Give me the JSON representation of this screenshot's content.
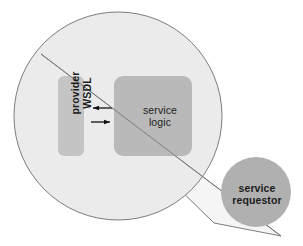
{
  "diagram": {
    "background_color": "#ffffff",
    "magnifier": {
      "name": "magnified-service-provider",
      "fill_color": "#ebebeb",
      "stroke_color": "#6e6e6e"
    },
    "cone": {
      "name": "magnifier-cone",
      "stroke_color": "#6e6e6e",
      "fill_color": "#f3f3f3"
    },
    "nodes": [
      {
        "id": "provider-wsdl",
        "label": "provider\nWSDL",
        "shape": "rounded-rectangle",
        "orientation": "vertical",
        "fill_color": "#c4c4c4"
      },
      {
        "id": "service-logic",
        "label": "service\nlogic",
        "shape": "rounded-rectangle",
        "orientation": "horizontal",
        "fill_color": "#b9b9b9"
      },
      {
        "id": "service-requestor",
        "label": "service\nrequestor",
        "shape": "circle",
        "fill_color": "#b0b0b0"
      }
    ],
    "connectors": [
      {
        "id": "logic-to-wsdl",
        "direction": "left",
        "from": "service-logic",
        "to": "provider-wsdl",
        "stroke_color": "#111111"
      },
      {
        "id": "wsdl-to-logic",
        "direction": "right",
        "from": "provider-wsdl",
        "to": "service-logic",
        "stroke_color": "#111111"
      }
    ]
  }
}
